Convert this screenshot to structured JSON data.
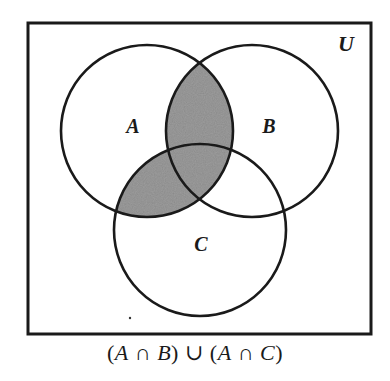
{
  "diagram": {
    "type": "venn",
    "universe": {
      "label": "U",
      "box": {
        "x": 28,
        "y": 23,
        "width": 343,
        "height": 311
      }
    },
    "sets": [
      {
        "id": "A",
        "label": "A",
        "cx": 147,
        "cy": 131,
        "r": 86,
        "label_x": 133,
        "label_y": 133
      },
      {
        "id": "B",
        "label": "B",
        "cx": 252,
        "cy": 131,
        "r": 86,
        "label_x": 269,
        "label_y": 133
      },
      {
        "id": "C",
        "label": "C",
        "cx": 200,
        "cy": 230,
        "r": 86,
        "label_x": 201,
        "label_y": 251
      }
    ],
    "shaded_regions": [
      "A∩B",
      "A∩C"
    ],
    "caption": "(A∩B)∪(A∩C)",
    "caption_parts": {
      "open1": "(",
      "a1": "A",
      "cap1": " ∩ ",
      "b": "B",
      "close1": ")",
      "union": " ∪ ",
      "open2": "(",
      "a2": "A",
      "cap2": " ∩ ",
      "c": "C",
      "close2": ")"
    },
    "colors": {
      "stroke": "#1a1a1a",
      "shade": "#8a8a8a",
      "background": "#ffffff"
    }
  }
}
